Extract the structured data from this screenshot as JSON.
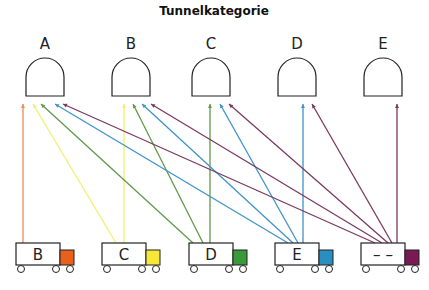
{
  "title": "Tunnelkategorie",
  "tunnels": [
    {
      "label": "A",
      "x": 45
    },
    {
      "label": "B",
      "x": 131
    },
    {
      "label": "C",
      "x": 211
    },
    {
      "label": "D",
      "x": 297
    },
    {
      "label": "E",
      "x": 383
    }
  ],
  "trucks": [
    {
      "label": "B",
      "x": 16,
      "color": "#e8601c"
    },
    {
      "label": "C",
      "x": 102,
      "color": "#f5e83a"
    },
    {
      "label": "D",
      "x": 189,
      "color": "#3a9a3a"
    },
    {
      "label": "E",
      "x": 275,
      "color": "#2a8fc0"
    },
    {
      "label": "– –",
      "x": 361,
      "color": "#7a1a55"
    }
  ],
  "arrows": [
    {
      "from": [
        23,
        243
      ],
      "to": [
        23,
        104
      ],
      "color": "#f08a50"
    },
    {
      "from": [
        116,
        243
      ],
      "to": [
        33,
        104
      ],
      "color": "#f2ef70"
    },
    {
      "from": [
        124,
        243
      ],
      "to": [
        124,
        104
      ],
      "color": "#f2ef70"
    },
    {
      "from": [
        193,
        243
      ],
      "to": [
        41,
        104
      ],
      "color": "#5f9a4a"
    },
    {
      "from": [
        203,
        243
      ],
      "to": [
        133,
        104
      ],
      "color": "#5f9a4a"
    },
    {
      "from": [
        210,
        243
      ],
      "to": [
        210,
        104
      ],
      "color": "#5f9a4a"
    },
    {
      "from": [
        288,
        243
      ],
      "to": [
        55,
        104
      ],
      "color": "#3f94c6"
    },
    {
      "from": [
        293,
        243
      ],
      "to": [
        142,
        104
      ],
      "color": "#3f94c6"
    },
    {
      "from": [
        298,
        243
      ],
      "to": [
        220,
        104
      ],
      "color": "#3f94c6"
    },
    {
      "from": [
        303,
        243
      ],
      "to": [
        303,
        104
      ],
      "color": "#3f94c6"
    },
    {
      "from": [
        375,
        243
      ],
      "to": [
        63,
        104
      ],
      "color": "#7a3a60"
    },
    {
      "from": [
        382,
        243
      ],
      "to": [
        151,
        104
      ],
      "color": "#7a3a60"
    },
    {
      "from": [
        388,
        243
      ],
      "to": [
        229,
        104
      ],
      "color": "#7a3a60"
    },
    {
      "from": [
        392,
        243
      ],
      "to": [
        312,
        104
      ],
      "color": "#7a3a60"
    },
    {
      "from": [
        397,
        243
      ],
      "to": [
        397,
        104
      ],
      "color": "#7a3a60"
    }
  ]
}
